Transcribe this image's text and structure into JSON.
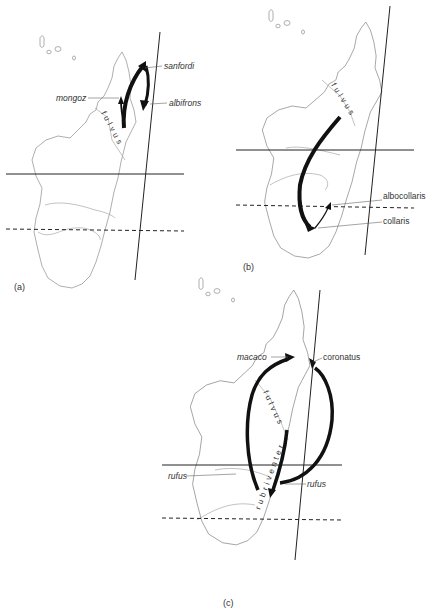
{
  "figure": {
    "panels": [
      {
        "id": "a",
        "label": "(a)",
        "range_label": "fulvus",
        "taxa": [
          {
            "name": "sanfordi"
          },
          {
            "name": "albifrons"
          },
          {
            "name": "mongoz"
          }
        ]
      },
      {
        "id": "b",
        "label": "(b)",
        "range_label": "fulvus",
        "taxa": [
          {
            "name": "albocollaris"
          },
          {
            "name": "collaris"
          }
        ]
      },
      {
        "id": "c",
        "label": "(c)",
        "range_label": "fulvus",
        "range_label_2": "rubriventer",
        "taxa": [
          {
            "name": "coronatus"
          },
          {
            "name": "macaco"
          },
          {
            "name": "rufus"
          },
          {
            "name": "rufus"
          }
        ]
      }
    ],
    "colors": {
      "coastline": "#9a9a9a",
      "arrows": "#111111",
      "lines": "#222222"
    }
  }
}
